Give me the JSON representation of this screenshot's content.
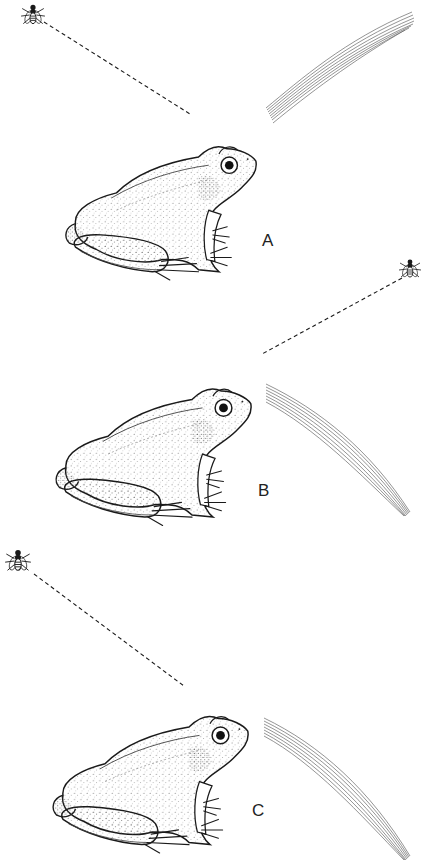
{
  "figure": {
    "panels": [
      {
        "label": "A",
        "fly_position": "upper-left",
        "sight_line": "dashed line from fly at upper-left down to frog's head",
        "striped_curve": "curving up and to the right, away from frog"
      },
      {
        "label": "B",
        "fly_position": "upper-right",
        "sight_line": "dashed line from fly at upper-right down to frog's head",
        "striped_curve": "curving down and to the right"
      },
      {
        "label": "C",
        "fly_position": "upper-left",
        "sight_line": "dashed line from fly at upper-left down to frog's head",
        "striped_curve": "curving down and to the right"
      }
    ],
    "icons": {
      "fly": "fly-icon",
      "frog": "frog-illustration",
      "sight_line": "dashed-line",
      "curve": "striped-curve"
    },
    "colors": {
      "ink": "#1a1a1a",
      "stipple": "#555555",
      "background": "#ffffff"
    }
  }
}
